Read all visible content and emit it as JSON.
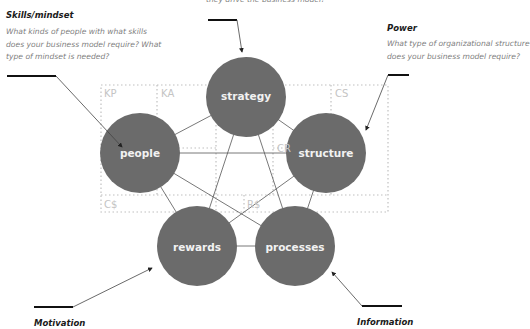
{
  "colors": {
    "circle_fill": "#6b6b6b",
    "circle_text": "#f2f2f2",
    "connector": "#555555",
    "grid_dots": "#c0c0c0",
    "grid_label": "#c4c4c4",
    "heading": "#1a1a1a",
    "body_text": "#808080"
  },
  "annotations": {
    "strategy": {
      "partial_text": "they drive the business model?"
    },
    "skills_mindset": {
      "title": "Skills/mindset",
      "body": "What kinds of people with what skills does your business model require? What type of mindset is needed?"
    },
    "power": {
      "title": "Power",
      "body": "What type of organizational structure does your business model require?"
    },
    "motivation": {
      "title": "Motivation"
    },
    "information": {
      "title": "Information"
    }
  },
  "nodes": [
    {
      "id": "strategy",
      "label": "strategy"
    },
    {
      "id": "people",
      "label": "people"
    },
    {
      "id": "structure",
      "label": "structure"
    },
    {
      "id": "rewards",
      "label": "rewards"
    },
    {
      "id": "processes",
      "label": "processes"
    }
  ],
  "grid_labels": {
    "kp": "KP",
    "ka": "KA",
    "vp": "VP",
    "cr": "CR",
    "cs": "CS",
    "c_cost": "C$",
    "r_revenue": "R$"
  }
}
